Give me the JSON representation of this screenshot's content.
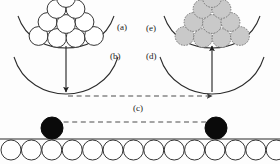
{
  "figure": {
    "background_color": "#fdfdfd",
    "width": 280,
    "height": 164,
    "labels": [
      {
        "id": "a",
        "text": "(a)",
        "x": 117,
        "y": 23,
        "describes": "open-circle cluster in upper-left bowl"
      },
      {
        "id": "b",
        "text": "(b)",
        "x": 110,
        "y": 52,
        "describes": "empty lower-left bowl"
      },
      {
        "id": "c",
        "text": "(c)",
        "x": 133,
        "y": 104,
        "describes": "horizontal transfer between substrate particles"
      },
      {
        "id": "d",
        "text": "(d)",
        "x": 146,
        "y": 52,
        "describes": "empty lower-right bowl"
      },
      {
        "id": "e",
        "text": "(e)",
        "x": 146,
        "y": 24,
        "describes": "shaded-circle cluster in upper-right bowl"
      }
    ],
    "colors": {
      "outline": "#2b2b2b",
      "shaded_fill": "#c9c9c9",
      "shaded_stroke": "#6e6e6e",
      "solid_fill": "#0a0a0a",
      "dashed_line": "#4d4d4d",
      "open_fill": "#ffffff"
    },
    "panels": {
      "left_cluster": {
        "label": "a",
        "fill_style": "open",
        "packing": "hexagonal",
        "circle_count": 10,
        "rows": [
          4,
          3,
          2,
          1
        ],
        "circle_radius": 9.5,
        "center_x": 66,
        "base_y": 36
      },
      "right_cluster": {
        "label": "e",
        "fill_style": "shaded",
        "packing": "hexagonal",
        "circle_count": 10,
        "rows": [
          4,
          3,
          2,
          1
        ],
        "circle_radius": 9.5,
        "center_x": 212,
        "base_y": 36
      },
      "upper_left_bowl": {
        "center_x": 66,
        "top_y": 16,
        "width": 96,
        "depth": 26
      },
      "upper_right_bowl": {
        "center_x": 212,
        "top_y": 16,
        "width": 96,
        "depth": 26
      },
      "lower_left_bowl": {
        "label": "b",
        "center_x": 66,
        "top_y": 57,
        "width": 96,
        "depth": 32,
        "empty": true
      },
      "lower_right_bowl": {
        "label": "d",
        "center_x": 212,
        "top_y": 57,
        "width": 96,
        "depth": 32,
        "empty": true
      }
    },
    "arrows": {
      "left_vertical": {
        "direction": "down",
        "x": 66,
        "from_y": 48,
        "to_y": 90,
        "style": "solid"
      },
      "right_vertical": {
        "direction": "up",
        "x": 212,
        "from_y": 90,
        "to_y": 48,
        "style": "solid"
      },
      "upper_dashed": {
        "direction": "right",
        "y": 96,
        "from_x": 68,
        "to_x": 210,
        "style": "dashed"
      },
      "lower_dashed": {
        "direction": "right",
        "y": 122,
        "from_x": 55,
        "to_x": 220,
        "style": "dashed"
      }
    },
    "substrate": {
      "line_y": 139,
      "circle_count": 14,
      "circle_radius": 10,
      "first_center_x": 11,
      "spacing": 20.4,
      "fill": "open"
    },
    "deposited_particles": [
      {
        "id": "left-particle",
        "x": 52,
        "y": 128,
        "radius": 11,
        "fill": "solid"
      },
      {
        "id": "right-particle",
        "x": 216,
        "y": 128,
        "radius": 11,
        "fill": "solid"
      }
    ]
  }
}
